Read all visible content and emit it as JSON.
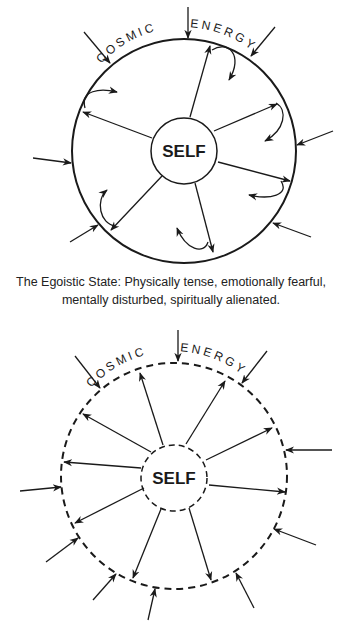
{
  "diagrams": [
    {
      "id": "egoistic",
      "outer_label_left": "COSMIC",
      "outer_label_right": "ENERGY",
      "center_label": "SELF",
      "boundary": "solid",
      "caption_line1": "The Egoistic State: Physically tense, emotionally fearful,",
      "caption_line2": "mentally disturbed, spiritually alienated."
    },
    {
      "id": "open",
      "outer_label_left": "COSMIC",
      "outer_label_right": "ENERGY",
      "center_label": "SELF",
      "boundary": "dashed"
    }
  ],
  "colors": {
    "ink": "#1a1a1a",
    "background": "#ffffff"
  }
}
